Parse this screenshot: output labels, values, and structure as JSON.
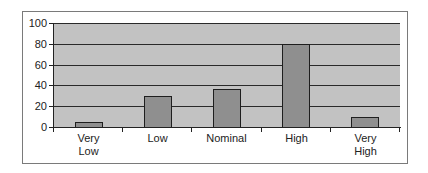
{
  "chart_data": {
    "type": "bar",
    "title": "",
    "xlabel": "",
    "ylabel": "",
    "categories": [
      "Very Low",
      "Low",
      "Nominal",
      "High",
      "Very High"
    ],
    "category_lines": [
      [
        "Very",
        "Low"
      ],
      [
        "Low"
      ],
      [
        "Nominal"
      ],
      [
        "High"
      ],
      [
        "Very",
        "High"
      ]
    ],
    "values": [
      5,
      30,
      37,
      80,
      10
    ],
    "ylim": [
      0,
      100
    ],
    "yticks": [
      "0",
      "20",
      "40",
      "60",
      "80",
      "100"
    ],
    "grid": true,
    "legend": null,
    "colors": {
      "plot_background": "#c2c2c2",
      "bar_fill": "#8f8f8f",
      "bar_border": "#1e1e1e",
      "gridline": "#2a2a2a"
    }
  }
}
